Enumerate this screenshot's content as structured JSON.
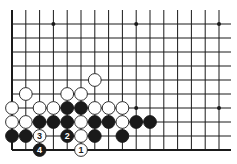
{
  "board": {
    "origin_x": 12,
    "bottom_y": 150,
    "spacing_x": 13.8,
    "spacing_y": 14,
    "columns": 17,
    "rows": 11,
    "right_x": 231,
    "top_y": 10,
    "star_points": [
      [
        3,
        4
      ],
      [
        9,
        4
      ],
      [
        15,
        4
      ],
      [
        3,
        10
      ],
      [
        9,
        10
      ],
      [
        15,
        10
      ]
    ],
    "colors": {
      "line": "#1a1a1a",
      "black_stone": "#1a1a1a",
      "white_stone": "#ffffff",
      "background": "#ffffff"
    }
  },
  "stones": [
    {
      "color": "white",
      "col": 6,
      "row": 6
    },
    {
      "color": "white",
      "col": 1,
      "row": 5
    },
    {
      "color": "white",
      "col": 4,
      "row": 5
    },
    {
      "color": "white",
      "col": 5,
      "row": 5
    },
    {
      "color": "white",
      "col": 0,
      "row": 4
    },
    {
      "color": "white",
      "col": 2,
      "row": 4
    },
    {
      "color": "white",
      "col": 3,
      "row": 4
    },
    {
      "color": "black",
      "col": 4,
      "row": 4
    },
    {
      "color": "black",
      "col": 5,
      "row": 4
    },
    {
      "color": "white",
      "col": 6,
      "row": 4
    },
    {
      "color": "white",
      "col": 7,
      "row": 4
    },
    {
      "color": "white",
      "col": 8,
      "row": 4
    },
    {
      "color": "white",
      "col": 0,
      "row": 3
    },
    {
      "color": "white",
      "col": 1,
      "row": 3
    },
    {
      "color": "black",
      "col": 2,
      "row": 3
    },
    {
      "color": "black",
      "col": 3,
      "row": 3
    },
    {
      "color": "black",
      "col": 4,
      "row": 3
    },
    {
      "color": "white",
      "col": 5,
      "row": 3
    },
    {
      "color": "black",
      "col": 6,
      "row": 3
    },
    {
      "color": "black",
      "col": 7,
      "row": 3
    },
    {
      "color": "white",
      "col": 8,
      "row": 3
    },
    {
      "color": "black",
      "col": 9,
      "row": 3
    },
    {
      "color": "black",
      "col": 10,
      "row": 3
    },
    {
      "color": "black",
      "col": 0,
      "row": 2
    },
    {
      "color": "black",
      "col": 1,
      "row": 2
    },
    {
      "color": "white",
      "col": 2,
      "row": 2,
      "label": "3"
    },
    {
      "color": "black",
      "col": 4,
      "row": 2,
      "label": "2"
    },
    {
      "color": "white",
      "col": 5,
      "row": 2
    },
    {
      "color": "black",
      "col": 6,
      "row": 2
    },
    {
      "color": "black",
      "col": 8,
      "row": 2
    },
    {
      "color": "black",
      "col": 2,
      "row": 1,
      "label": "4"
    },
    {
      "color": "white",
      "col": 5,
      "row": 1,
      "label": "1"
    }
  ]
}
